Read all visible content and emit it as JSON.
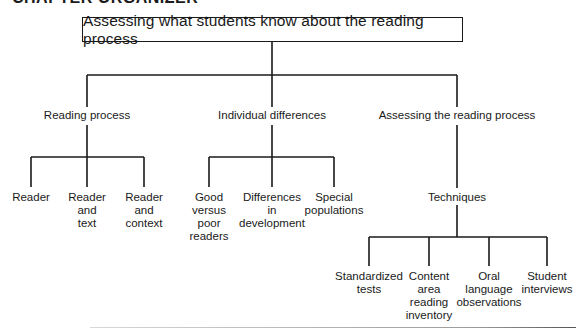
{
  "header": {
    "title": "CHAPTER ORGANIZER"
  },
  "root": {
    "label": "Assessing what students know about the reading process"
  },
  "branches": [
    {
      "label": "Reading process",
      "children": [
        {
          "label": "Reader"
        },
        {
          "label": "Reader\nand\ntext"
        },
        {
          "label": "Reader\nand\ncontext"
        }
      ]
    },
    {
      "label": "Individual differences",
      "children": [
        {
          "label": "Good\nversus\npoor\nreaders"
        },
        {
          "label": "Differences\nin\ndevelopment"
        },
        {
          "label": "Special\npopulations"
        }
      ]
    },
    {
      "label": "Assessing the reading process",
      "sub": {
        "label": "Techniques",
        "children": [
          {
            "label": "Standardized\ntests"
          },
          {
            "label": "Content\narea\nreading\ninventory"
          },
          {
            "label": "Oral\nlanguage\nobservations"
          },
          {
            "label": "Student\ninterviews"
          }
        ]
      }
    }
  ]
}
